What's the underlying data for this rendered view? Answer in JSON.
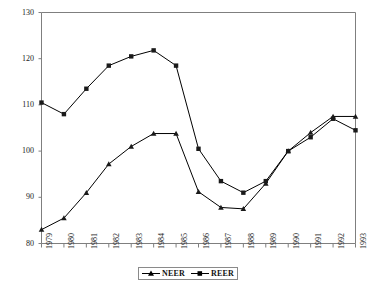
{
  "chart_data": {
    "type": "line",
    "title": "",
    "subtitle": "",
    "xlabel": "",
    "ylabel": "",
    "x": [
      1979,
      1980,
      1981,
      1982,
      1983,
      1984,
      1985,
      1986,
      1987,
      1988,
      1989,
      1990,
      1991,
      1992,
      1993
    ],
    "categories": [
      "1979",
      "1980",
      "1981",
      "1982",
      "1983",
      "1984",
      "1985",
      "1986",
      "1987",
      "1988",
      "1989",
      "1990",
      "1991",
      "1992",
      "1993"
    ],
    "xlim": [
      1979,
      1993
    ],
    "ylim": [
      80,
      130
    ],
    "y_ticks": [
      80,
      90,
      100,
      110,
      120,
      130
    ],
    "x_ticks": [
      "1979",
      "1980",
      "1981",
      "1982",
      "1983",
      "1984",
      "1985",
      "1986",
      "1987",
      "1988",
      "1989",
      "1990",
      "1991",
      "1992",
      "1993"
    ],
    "grid": false,
    "legend_position": "bottom-center",
    "series": [
      {
        "name": "NEER",
        "marker": "triangle",
        "color": "#000000",
        "values": [
          83.0,
          85.5,
          91.0,
          97.2,
          101.0,
          103.8,
          103.8,
          91.2,
          87.8,
          87.5,
          93.0,
          100.0,
          104.0,
          107.5,
          107.5
        ]
      },
      {
        "name": "REER",
        "marker": "square",
        "color": "#000000",
        "values": [
          110.5,
          108.0,
          113.5,
          118.5,
          120.5,
          121.8,
          118.5,
          100.5,
          93.5,
          91.0,
          93.5,
          100.0,
          103.0,
          107.0,
          104.5
        ]
      }
    ]
  },
  "legend": {
    "entries": [
      {
        "label": "NEER"
      },
      {
        "label": "REER"
      }
    ]
  },
  "axes": {
    "y_tick_labels": [
      "130",
      "120",
      "110",
      "100",
      "90",
      "80"
    ],
    "x_tick_labels": [
      "1979",
      "1980",
      "1981",
      "1982",
      "1983",
      "1984",
      "1985",
      "1986",
      "1987",
      "1988",
      "1989",
      "1990",
      "1991",
      "1992",
      "1993"
    ]
  },
  "style": {
    "axis_color": "#7f7f7f",
    "line_color": "#1a1a1a",
    "background": "#ffffff"
  }
}
